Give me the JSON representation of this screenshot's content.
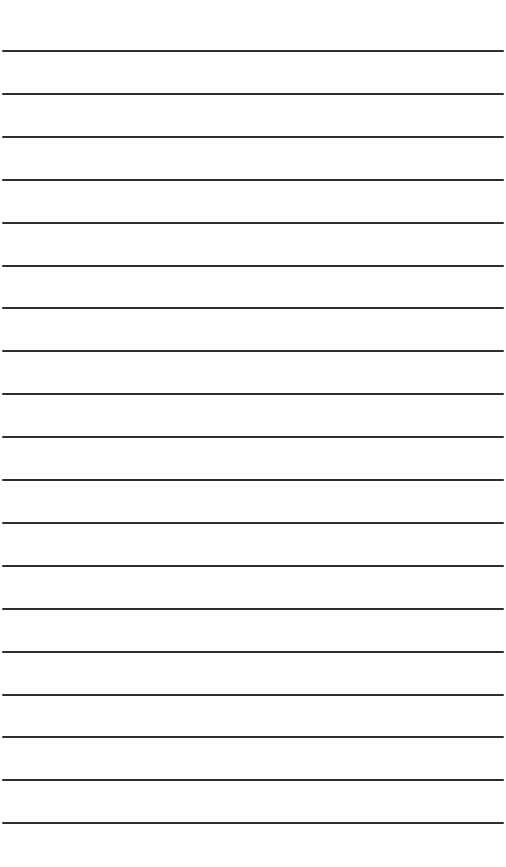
{
  "page": {
    "type": "lined-paper",
    "background": "#ffffff",
    "line_color": "#2e2e2e",
    "line_count": 19,
    "first_line_y": 50,
    "line_spacing": 42.9,
    "line_thickness": 2,
    "line_left": 2,
    "line_width": 502
  }
}
